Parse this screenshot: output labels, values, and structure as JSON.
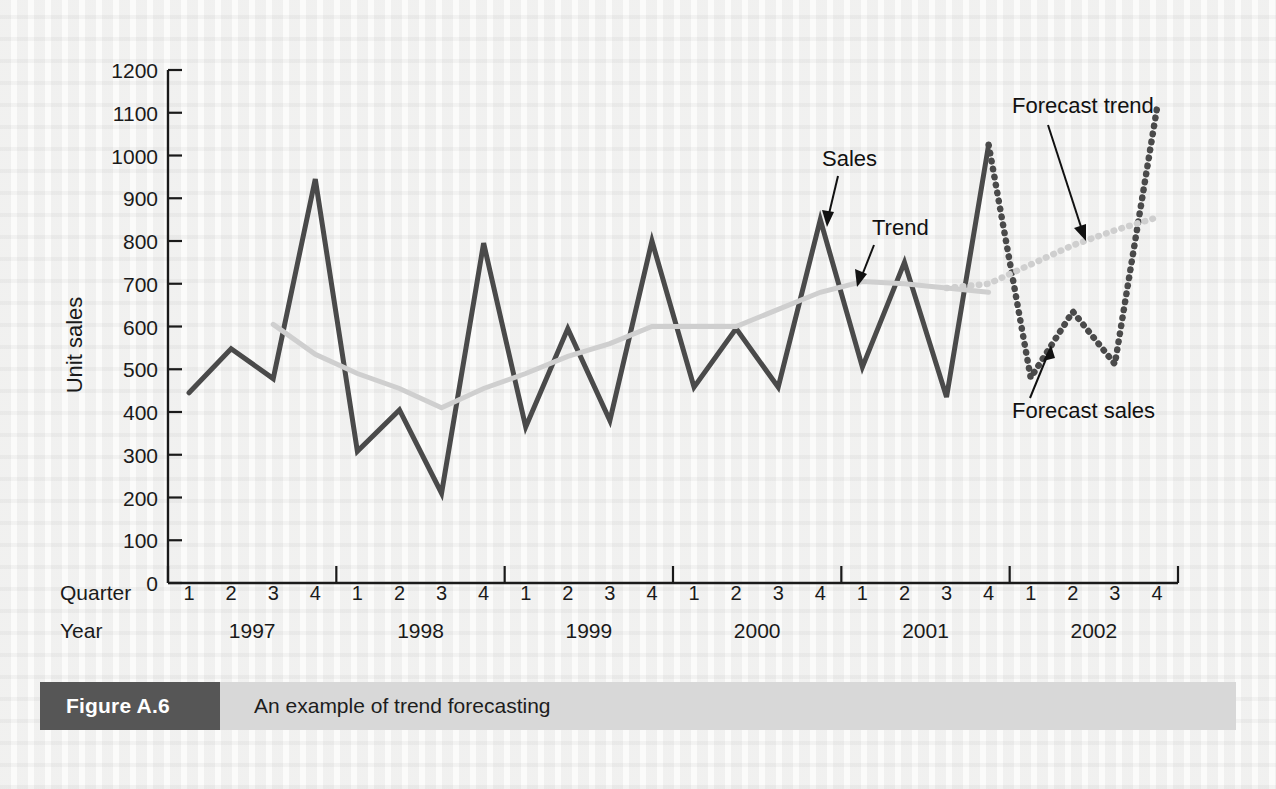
{
  "figure": {
    "number_label": "Figure A.6",
    "caption": "An example of trend forecasting"
  },
  "axes": {
    "y_axis_title": "Unit sales",
    "quarter_row_label": "Quarter",
    "year_row_label": "Year"
  },
  "annotations": {
    "sales": "Sales",
    "trend": "Trend",
    "forecast_trend": "Forecast trend",
    "forecast_sales": "Forecast sales"
  },
  "colors": {
    "sales_line": "#4a4a4a",
    "trend_line": "#cfcfcf",
    "forecast_line": "#4a4a4a",
    "forecast_trend_line": "#cfcfcf",
    "axis": "#1a1a1a",
    "caption_number_bg": "#565656",
    "caption_title_bg": "#d8d8d8",
    "page_bg": "#fbfbfa"
  },
  "chart_data": {
    "type": "line",
    "title": "An example of trend forecasting",
    "xlabel": "Quarter / Year",
    "ylabel": "Unit sales",
    "ylim": [
      0,
      1200
    ],
    "ytick_labels": [
      "0",
      "100",
      "200",
      "300",
      "400",
      "500",
      "600",
      "700",
      "800",
      "900",
      "1000",
      "1100",
      "1200"
    ],
    "ytick_values": [
      0,
      100,
      200,
      300,
      400,
      500,
      600,
      700,
      800,
      900,
      1000,
      1100,
      1200
    ],
    "grid": false,
    "legend": "annotated-arrows",
    "quarters": [
      "1",
      "2",
      "3",
      "4",
      "1",
      "2",
      "3",
      "4",
      "1",
      "2",
      "3",
      "4",
      "1",
      "2",
      "3",
      "4",
      "1",
      "2",
      "3",
      "4",
      "1",
      "2",
      "3",
      "4"
    ],
    "years": [
      "1997",
      "1998",
      "1999",
      "2000",
      "2001",
      "2002"
    ],
    "quarters_per_year": 4,
    "x_labels": [
      "1997 Q1",
      "1997 Q2",
      "1997 Q3",
      "1997 Q4",
      "1998 Q1",
      "1998 Q2",
      "1998 Q3",
      "1998 Q4",
      "1999 Q1",
      "1999 Q2",
      "1999 Q3",
      "1999 Q4",
      "2000 Q1",
      "2000 Q2",
      "2000 Q3",
      "2000 Q4",
      "2001 Q1",
      "2001 Q2",
      "2001 Q3",
      "2001 Q4",
      "2002 Q1",
      "2002 Q2",
      "2002 Q3",
      "2002 Q4"
    ],
    "series": [
      {
        "name": "Sales",
        "style": "solid",
        "color": "#4a4a4a",
        "x_index": [
          0,
          1,
          2,
          3,
          4,
          5,
          6,
          7,
          8,
          9,
          10,
          11,
          12,
          13,
          14,
          15,
          16,
          17,
          18,
          19
        ],
        "values": [
          445,
          548,
          478,
          945,
          308,
          405,
          210,
          795,
          365,
          595,
          380,
          800,
          458,
          595,
          458,
          850,
          505,
          750,
          435,
          1025
        ]
      },
      {
        "name": "Trend",
        "style": "solid",
        "color": "#cfcfcf",
        "x_index": [
          2,
          3,
          4,
          5,
          6,
          7,
          8,
          9,
          10,
          11,
          12,
          13,
          14,
          15,
          16,
          17,
          18,
          19
        ],
        "values": [
          605,
          535,
          490,
          455,
          410,
          455,
          490,
          530,
          560,
          600,
          600,
          600,
          640,
          680,
          705,
          700,
          690,
          680
        ]
      },
      {
        "name": "Forecast sales",
        "style": "dotted",
        "color": "#4a4a4a",
        "x_index": [
          19,
          20,
          21,
          22,
          23
        ],
        "values": [
          1025,
          480,
          635,
          512,
          1110
        ]
      },
      {
        "name": "Forecast trend",
        "style": "dotted",
        "color": "#cfcfcf",
        "x_index": [
          18,
          19,
          20,
          21,
          22,
          23
        ],
        "values": [
          690,
          700,
          745,
          790,
          825,
          855
        ]
      }
    ]
  }
}
